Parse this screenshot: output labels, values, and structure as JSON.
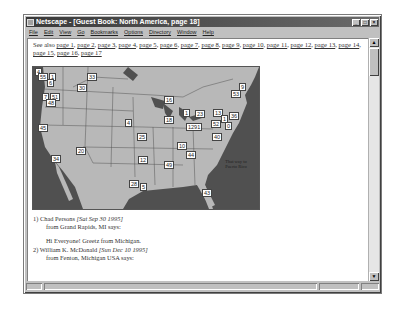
{
  "window": {
    "title": "Netscape - [Guest Book: North America, page 18]",
    "buttons": {
      "minimize": "_",
      "maximize": "□",
      "close": "×"
    }
  },
  "menubar": {
    "items": [
      "File",
      "Edit",
      "View",
      "Go",
      "Bookmarks",
      "Options",
      "Directory",
      "Window",
      "Help"
    ]
  },
  "content": {
    "see_also_prefix": "See also ",
    "pages": [
      "page 1",
      "page 2",
      "page 3",
      "page 4",
      "page 5",
      "page 6",
      "page 7",
      "page 8",
      "page 9",
      "page 10",
      "page 11",
      "page 12",
      "page 13",
      "page 14",
      "page 15",
      "page 16",
      "page 17"
    ],
    "map": {
      "ocean_label": "That way to Puerto Rico",
      "markers": [
        {
          "label": "4",
          "x": 2,
          "y": 1
        },
        {
          "label": "55",
          "x": 5,
          "y": 6
        },
        {
          "label": "1",
          "x": 16,
          "y": 6
        },
        {
          "label": "6",
          "x": 14,
          "y": 12
        },
        {
          "label": "33",
          "x": 54,
          "y": 6
        },
        {
          "label": "30",
          "x": 44,
          "y": 17
        },
        {
          "label": "7",
          "x": 9,
          "y": 26
        },
        {
          "label": "51",
          "x": 17,
          "y": 26
        },
        {
          "label": "48",
          "x": 13,
          "y": 32
        },
        {
          "label": "45",
          "x": 5,
          "y": 57
        },
        {
          "label": "4",
          "x": 92,
          "y": 52
        },
        {
          "label": "16",
          "x": 131,
          "y": 29
        },
        {
          "label": "1",
          "x": 150,
          "y": 42
        },
        {
          "label": "18",
          "x": 131,
          "y": 49
        },
        {
          "label": "23",
          "x": 162,
          "y": 43
        },
        {
          "label": "13",
          "x": 180,
          "y": 42
        },
        {
          "label": "9",
          "x": 206,
          "y": 16
        },
        {
          "label": "53",
          "x": 198,
          "y": 23
        },
        {
          "label": "36",
          "x": 196,
          "y": 45
        },
        {
          "label": "1",
          "x": 188,
          "y": 48
        },
        {
          "label": "52",
          "x": 178,
          "y": 53
        },
        {
          "label": "0",
          "x": 192,
          "y": 55
        },
        {
          "label": "1291",
          "x": 153,
          "y": 56
        },
        {
          "label": "40",
          "x": 179,
          "y": 66
        },
        {
          "label": "25",
          "x": 104,
          "y": 66
        },
        {
          "label": "20",
          "x": 43,
          "y": 80
        },
        {
          "label": "12",
          "x": 105,
          "y": 89
        },
        {
          "label": "10",
          "x": 144,
          "y": 75
        },
        {
          "label": "44",
          "x": 153,
          "y": 84
        },
        {
          "label": "49",
          "x": 131,
          "y": 94
        },
        {
          "label": "34",
          "x": 18,
          "y": 88
        },
        {
          "label": "28",
          "x": 96,
          "y": 113
        },
        {
          "label": "5",
          "x": 107,
          "y": 116
        },
        {
          "label": "43",
          "x": 169,
          "y": 122
        }
      ]
    },
    "entries": [
      {
        "number": "1)",
        "name": "Chad Persons",
        "date": "[Sat Sep 30 1995]",
        "from": "from Grand Rapids, MI says:",
        "message": "Hi Everyone! Greetz from Michigan."
      },
      {
        "number": "2)",
        "name": "William K. McDonald",
        "date": "[Sun Dec 10 1995]",
        "from": "from Fenton, Michigan USA says:",
        "message": ""
      }
    ]
  },
  "statusbar": {
    "left": "",
    "text": "",
    "right": ""
  },
  "colors": {
    "titlebar": "#3a3a3a",
    "chrome": "#c0c0c0",
    "ocean": "#505050",
    "land": "#b8b8b8"
  }
}
